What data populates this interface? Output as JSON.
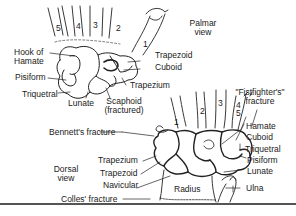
{
  "diagram": {
    "palmar": {
      "view_label_1": "Palmar",
      "view_label_2": "view",
      "digits": [
        "5",
        "4",
        "3",
        "2",
        "1"
      ],
      "labels": {
        "hook_of_hamate_1": "Hook of",
        "hook_of_hamate_2": "Hamate",
        "pisiform": "Pisiform",
        "triquetral": "Triquetral",
        "lunate": "Lunate",
        "scaphoid_1": "Scaphoid",
        "scaphoid_2": "(fractured)",
        "trapezoid": "Trapezoid",
        "cuboid": "Cuboid",
        "trapezium": "Trapezium"
      }
    },
    "dorsal": {
      "view_label_1": "Dorsal",
      "view_label_2": "view",
      "digits": [
        "1",
        "2",
        "3",
        "4",
        "5"
      ],
      "labels": {
        "fistfighter_1": "\"Fistfighter's\"",
        "fistfighter_2": "fracture",
        "bennett": "Bennett's fracture",
        "trapezium": "Trapezium",
        "trapezoid": "Trapezoid",
        "navicular": "Navicular",
        "colles": "Colles' fracture",
        "hamate": "Hamate",
        "cuboid": "Cuboid",
        "triquetral": "Triquetral",
        "pisiform": "Pisiform",
        "lunate": "Lunate",
        "radius": "Radius",
        "ulna": "Ulna"
      }
    }
  }
}
